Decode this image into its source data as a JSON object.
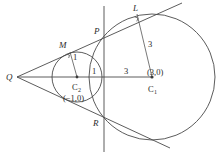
{
  "figure": {
    "background_color": "#ffffff",
    "stroke_color": "#4a4a4a"
  },
  "points": {
    "Q": {
      "label": "Q",
      "x": 17,
      "y": 77,
      "role": "external-intersection-of-tangents"
    },
    "M": {
      "label": "M",
      "x": 70,
      "y": 52,
      "role": "tangent-point-small-circle"
    },
    "L": {
      "label": "L",
      "x": 137,
      "y": 14,
      "role": "tangent-point-large-circle"
    },
    "P": {
      "label": "P",
      "x": 98,
      "y": 33,
      "role": "upper-intersection-radical-axis"
    },
    "R": {
      "label": "R",
      "x": 96,
      "y": 122,
      "role": "lower-intersection-radical-axis"
    },
    "C1": {
      "label": "C",
      "subscript": "1",
      "x": 152,
      "y": 77,
      "role": "center-large-circle"
    },
    "C2": {
      "label": "C",
      "subscript": "2",
      "x": 77,
      "y": 77,
      "role": "center-small-circle"
    }
  },
  "coordinate_labels": {
    "C1_coords": "(3,0)",
    "C2_coords": "(−1,0)"
  },
  "measurements": {
    "small_radius_label": "1",
    "large_radius_label": "3",
    "axis_segment_small": "1",
    "axis_segment_large": "3"
  },
  "circles": {
    "small": {
      "cx": 77,
      "cy": 77,
      "r": 25,
      "center_label": "C2"
    },
    "large": {
      "cx": 152,
      "cy": 77,
      "r": 63,
      "center_label": "C1"
    }
  },
  "lines": {
    "radical_axis": {
      "x": 104,
      "y1": 6,
      "y2": 152,
      "name": "vertical-line"
    },
    "horizontal_axis": {
      "x1": 17,
      "x2": 152,
      "y": 77,
      "name": "center-line"
    },
    "upper_tangent": {
      "x1": 17,
      "y1": 77,
      "x2": 182,
      "y2": 3,
      "name": "upper-tangent-line"
    },
    "lower_tangent": {
      "x1": 17,
      "y1": 77,
      "x2": 170,
      "y2": 148,
      "name": "lower-tangent-line"
    },
    "radius_small": {
      "x1": 77,
      "y1": 77,
      "x2": 70,
      "y2": 52,
      "name": "radius-to-M"
    },
    "radius_large": {
      "x1": 152,
      "y1": 77,
      "x2": 137,
      "y2": 14,
      "name": "radius-to-L"
    }
  },
  "right_angle_marks": [
    {
      "at": "M",
      "name": "right-angle-at-M"
    },
    {
      "at": "L",
      "name": "right-angle-at-L"
    }
  ]
}
